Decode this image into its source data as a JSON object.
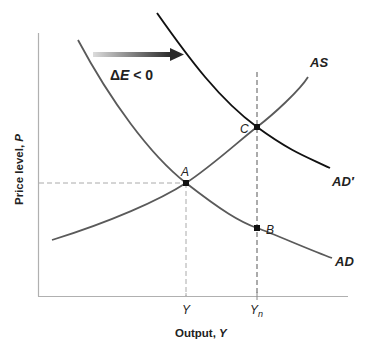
{
  "diagram": {
    "title": "",
    "x_axis": {
      "label": "Output, ",
      "label_var": "Y",
      "ticks": [
        {
          "label": "Y",
          "sub": ""
        },
        {
          "label": "Y",
          "sub": "n"
        }
      ]
    },
    "y_axis": {
      "label": "Price level, ",
      "label_var": "P"
    },
    "curves": {
      "as": {
        "label": "AS",
        "color": "#555555"
      },
      "ad": {
        "label": "AD",
        "color": "#555555"
      },
      "ad_prime": {
        "label": "AD′",
        "color": "#111111"
      }
    },
    "points": [
      {
        "id": "A",
        "label": "A"
      },
      {
        "id": "B",
        "label": "B"
      },
      {
        "id": "C",
        "label": "C"
      }
    ],
    "shift_arrow": {
      "label_delta": "Δ",
      "label_var": "E",
      "label_rest": " < 0",
      "color_start": "#d8d8d8",
      "color_end": "#2a2a2a"
    },
    "guide_color": "#aaaaaa",
    "axis_color": "#aaaaaa"
  }
}
